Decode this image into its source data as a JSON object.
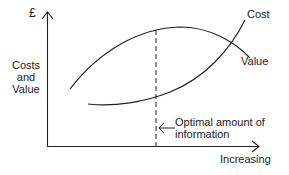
{
  "diagram": {
    "y_axis_unit": "£",
    "y_axis_label": [
      "Costs",
      "and",
      "Value"
    ],
    "x_axis_label": "Increasing",
    "curves": {
      "cost_label": "Cost",
      "value_label": "Value"
    },
    "annotation": [
      "Optimal amount of",
      "information"
    ],
    "colors": {
      "line": "#222222",
      "background": "#ffffff"
    }
  }
}
